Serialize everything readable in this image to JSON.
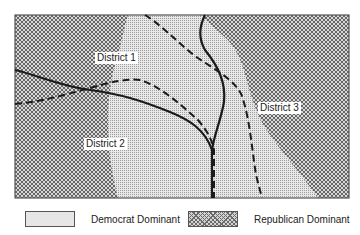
{
  "map": {
    "frame": {
      "x": 15,
      "y": 15,
      "width": 334,
      "height": 183
    },
    "colors": {
      "democrat_fill": "#e6e6e6",
      "republican_fill": "#d4d4d4",
      "boundary_line": "#1a1a1a"
    },
    "districts": [
      {
        "label": "District 1",
        "x": 95,
        "y": 52
      },
      {
        "label": "District 2",
        "x": 84,
        "y": 138
      },
      {
        "label": "District 3",
        "x": 258,
        "y": 102
      }
    ],
    "line_types": {
      "solid": "road / natural boundary",
      "dashed": "district boundary"
    }
  },
  "legend": {
    "items": [
      {
        "label": "Democrat Dominant",
        "pattern": "fine-dot"
      },
      {
        "label": "Republican Dominant",
        "pattern": "crosshatch"
      }
    ]
  }
}
